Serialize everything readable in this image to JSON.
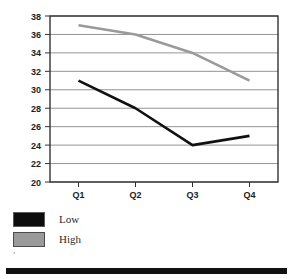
{
  "chart_data": {
    "type": "line",
    "title": "",
    "subtitle": "",
    "xlabel": "",
    "ylabel": "",
    "categories": [
      "Q1",
      "Q2",
      "Q3",
      "Q4"
    ],
    "series": [
      {
        "name": "Low",
        "values": [
          31,
          28,
          24,
          25
        ],
        "color": "#111111"
      },
      {
        "name": "High",
        "values": [
          37,
          36,
          34,
          31
        ],
        "color": "#9a9a9a"
      }
    ],
    "ylim": [
      20,
      38
    ],
    "ytick_step": 2,
    "yticks": [
      20,
      22,
      24,
      26,
      28,
      30,
      32,
      34,
      36,
      38
    ],
    "grid": true,
    "grid_axis": "y",
    "legend_position": "below-left",
    "legend": [
      {
        "label": "Low",
        "swatch": "#111111"
      },
      {
        "label": "High",
        "swatch": "#9a9a9a"
      }
    ]
  },
  "top_caption": "",
  "stray_mark": "′",
  "colors": {
    "low_series": "#111111",
    "high_series": "#9a9a9a",
    "grid": "#888888",
    "axis": "#333333",
    "footer_bar": "#111111"
  }
}
